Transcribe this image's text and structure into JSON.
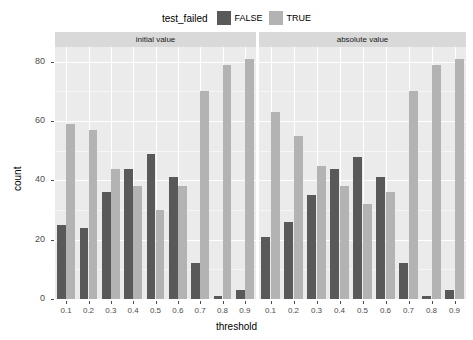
{
  "chart_data": {
    "type": "bar",
    "title": "",
    "xlabel": "threshold",
    "ylabel": "count",
    "ylim": [
      0,
      85
    ],
    "yticks": [
      0,
      20,
      40,
      60,
      80
    ],
    "grid": true,
    "legend_position": "top",
    "legend_title": "test_failed",
    "categories": [
      "0.1",
      "0.2",
      "0.3",
      "0.4",
      "0.5",
      "0.6",
      "0.7",
      "0.8",
      "0.9"
    ],
    "facets": [
      {
        "label": "initial value",
        "series": [
          {
            "name": "FALSE",
            "color": "#595959",
            "values": [
              25,
              24,
              36,
              44,
              49,
              41,
              12,
              1,
              3
            ]
          },
          {
            "name": "TRUE",
            "color": "#b3b3b3",
            "values": [
              59,
              57,
              44,
              38,
              30,
              38,
              70,
              79,
              81
            ]
          }
        ]
      },
      {
        "label": "absolute value",
        "series": [
          {
            "name": "FALSE",
            "color": "#595959",
            "values": [
              21,
              26,
              35,
              44,
              48,
              41,
              12,
              1,
              3
            ]
          },
          {
            "name": "TRUE",
            "color": "#b3b3b3",
            "values": [
              63,
              55,
              45,
              38,
              32,
              36,
              70,
              79,
              81
            ]
          }
        ]
      }
    ]
  },
  "legend": {
    "title": "test_failed",
    "items": [
      {
        "label": "FALSE",
        "color": "#595959"
      },
      {
        "label": "TRUE",
        "color": "#b3b3b3"
      }
    ]
  },
  "axes": {
    "x_title": "threshold",
    "y_title": "count",
    "y_tick_labels": [
      "0",
      "20",
      "40",
      "60",
      "80"
    ],
    "x_tick_labels": [
      "0.1",
      "0.2",
      "0.3",
      "0.4",
      "0.5",
      "0.6",
      "0.7",
      "0.8",
      "0.9"
    ]
  },
  "panels": [
    {
      "strip_label": "initial value"
    },
    {
      "strip_label": "absolute value"
    }
  ],
  "theme": {
    "panel_background": "#ebebeb",
    "strip_background": "#d9d9d9",
    "gridline_color": "#ffffff",
    "plot_background": "#ffffff"
  }
}
